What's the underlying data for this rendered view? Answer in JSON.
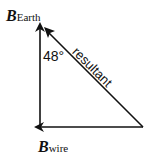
{
  "diagram": {
    "vectors": [
      {
        "name": "B_Earth",
        "symbol": "B",
        "subscript": "Earth",
        "direction": "up"
      },
      {
        "name": "B_wire",
        "symbol": "B",
        "subscript": "wire",
        "direction": "left"
      },
      {
        "name": "resultant",
        "label": "resultant",
        "direction": "up-left"
      }
    ],
    "angle_label": "48°",
    "b_earth": {
      "symbol": "B",
      "subscript": "Earth"
    },
    "b_wire": {
      "symbol": "B",
      "subscript": "wire"
    },
    "resultant_label": "resultant",
    "line_color": "#111111"
  }
}
